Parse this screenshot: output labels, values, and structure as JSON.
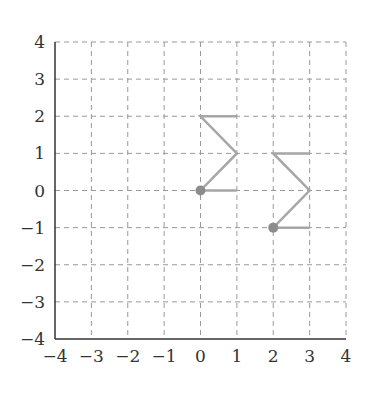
{
  "chart_data": {
    "type": "diagram",
    "title": "",
    "xlabel": "",
    "ylabel": "",
    "xlim": [
      -4,
      4
    ],
    "ylim": [
      -4,
      4
    ],
    "grid": true,
    "x_ticks": [
      "−4",
      "−3",
      "−2",
      "−1",
      "0",
      "1",
      "2",
      "3",
      "4"
    ],
    "y_ticks": [
      "4",
      "3",
      "2",
      "1",
      "0",
      "−1",
      "−2",
      "−3",
      "−4"
    ],
    "shapes": [
      {
        "name": "sigma-shape-original",
        "start_point": [
          0,
          0
        ],
        "path": [
          [
            1,
            0
          ],
          [
            0,
            0
          ],
          [
            1,
            1
          ],
          [
            0,
            2
          ],
          [
            1,
            2
          ]
        ]
      },
      {
        "name": "sigma-shape-translated",
        "start_point": [
          2,
          -1
        ],
        "path": [
          [
            3,
            -1
          ],
          [
            2,
            -1
          ],
          [
            3,
            0
          ],
          [
            2,
            1
          ],
          [
            3,
            1
          ]
        ]
      }
    ],
    "colors": {
      "grid": "#999999",
      "axis": "#333333",
      "shape": "#a6a6a6",
      "point": "#8c8c8c"
    }
  }
}
